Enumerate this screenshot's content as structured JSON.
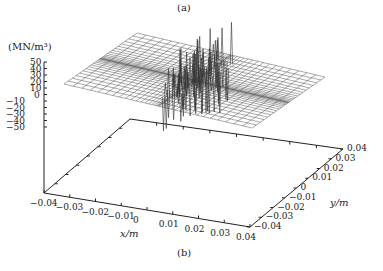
{
  "chart_data": {
    "type": "surface3d",
    "title": "",
    "top_caption": "(a)",
    "bottom_caption": "(b)",
    "zlabel": "(MN/m³)",
    "xlabel": "x/m",
    "ylabel": "y/m",
    "zticks": [
      "50",
      "40",
      "30",
      "20",
      "10",
      "0",
      "−10",
      "−20",
      "−30",
      "−40",
      "−50"
    ],
    "xticks": [
      "−0.04",
      "−0.03",
      "−0.02",
      "−0.01",
      "0",
      "0.01",
      "0.02",
      "0.03",
      "0.04"
    ],
    "yticks": [
      "−0.04",
      "−0.03",
      "−0.02",
      "−0.01",
      "0",
      "0.01",
      "0.02",
      "0.03",
      "0.04"
    ],
    "zlim": [
      -50,
      50
    ],
    "xlim": [
      -0.04,
      0.04
    ],
    "ylim": [
      -0.04,
      0.04
    ],
    "grid": false,
    "surface_description": "Wireframe mesh flat at z≈0 over the domain, refined mesh bands along x≈0 and y≈0, with oscillating spikes concentrated near x≈0 (−0.005 to 0.005) reaching about +50 and −50 MN/m³",
    "peak_max": 50,
    "peak_min": -50
  }
}
